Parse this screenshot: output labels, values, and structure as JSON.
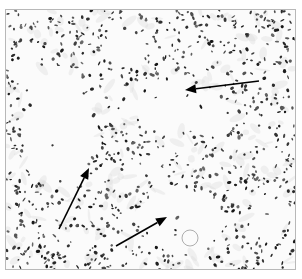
{
  "figure": {
    "type": "grayscale histology micrograph",
    "background": "#fbfbfb",
    "nucleus_color": "#1a1a1a",
    "stroma_color": "#d9d9d9",
    "border_color": "#b8b8b8"
  },
  "arrows": [
    {
      "id": "arrow-1",
      "from": [
        253,
        71
      ],
      "to": [
        179,
        80
      ],
      "color": "#000000"
    },
    {
      "id": "arrow-2",
      "from": [
        53,
        219
      ],
      "to": [
        83,
        158
      ],
      "color": "#000000"
    },
    {
      "id": "arrow-3",
      "from": [
        110,
        236
      ],
      "to": [
        161,
        207
      ],
      "color": "#000000"
    }
  ],
  "caption": {
    "text": ""
  }
}
